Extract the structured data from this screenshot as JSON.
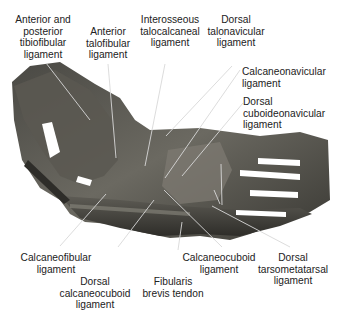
{
  "figure": {
    "background_color": "#ffffff",
    "specimen_colors": [
      "#3a3a36",
      "#55544e",
      "#6e6c64",
      "#8a877d",
      "#2a2a27"
    ],
    "leader_line_color": "#dcdcdc"
  },
  "labels": [
    {
      "id": "ant-post-tibiofibular",
      "lines": [
        "Anterior and",
        "posterior",
        "tibiofibular",
        "ligament"
      ]
    },
    {
      "id": "ant-talofibular",
      "lines": [
        "Anterior",
        "talofibular",
        "ligament"
      ]
    },
    {
      "id": "interosseous-talocalcaneal",
      "lines": [
        "Interosseous",
        "talocalcaneal",
        "ligament"
      ]
    },
    {
      "id": "dorsal-talonavicular",
      "lines": [
        "Dorsal",
        "talonavicular",
        "ligament"
      ]
    },
    {
      "id": "calcaneonavicular",
      "lines": [
        "Calcaneonavicular",
        "ligament"
      ]
    },
    {
      "id": "dorsal-cuboideonavicular",
      "lines": [
        "Dorsal",
        "cuboideonavicular",
        "ligament"
      ]
    },
    {
      "id": "calcaneofibular",
      "lines": [
        "Calcaneofibular",
        "ligament"
      ]
    },
    {
      "id": "dorsal-calcaneocuboid",
      "lines": [
        "Dorsal",
        "calcaneocuboid",
        "ligament"
      ]
    },
    {
      "id": "fibularis-brevis",
      "lines": [
        "Fibularis",
        "brevis tendon"
      ]
    },
    {
      "id": "calcaneocuboid",
      "lines": [
        "Calcaneocuboid",
        "ligament"
      ]
    },
    {
      "id": "dorsal-tarsometatarsal",
      "lines": [
        "Dorsal",
        "tarsometatarsal",
        "ligament"
      ]
    }
  ]
}
